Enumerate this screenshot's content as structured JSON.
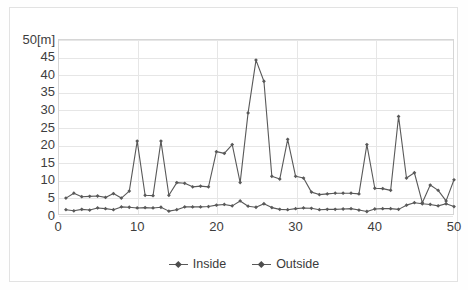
{
  "chart_data": {
    "type": "line",
    "title": "",
    "xlabel": "",
    "ylabel": "[m]",
    "y_unit_label": "50[m]",
    "xlim": [
      0,
      50
    ],
    "ylim": [
      0,
      50
    ],
    "y_ticks": [
      0,
      5,
      10,
      15,
      20,
      25,
      30,
      35,
      40,
      45,
      50
    ],
    "y_tick_labels": [
      "0",
      "5",
      "10",
      "15",
      "20",
      "25",
      "30",
      "35",
      "40",
      "45",
      "50[m]"
    ],
    "x_ticks": [
      0,
      10,
      20,
      30,
      40,
      50
    ],
    "x_tick_labels": [
      "0",
      "10",
      "20",
      "30",
      "40",
      "50"
    ],
    "grid": true,
    "legend_position": "bottom",
    "marker": "diamond",
    "x": [
      1,
      2,
      3,
      4,
      5,
      6,
      7,
      8,
      9,
      10,
      11,
      12,
      13,
      14,
      15,
      16,
      17,
      18,
      19,
      20,
      21,
      22,
      23,
      24,
      25,
      26,
      27,
      28,
      29,
      30,
      31,
      32,
      33,
      34,
      35,
      36,
      37,
      38,
      39,
      40,
      41,
      42,
      43,
      44,
      45,
      46,
      47,
      48,
      49,
      50
    ],
    "series": [
      {
        "name": "Inside",
        "color": "#595959",
        "values": [
          1.5,
          1.2,
          1.6,
          1.4,
          2.0,
          1.8,
          1.5,
          2.3,
          2.2,
          2.0,
          2.1,
          2.0,
          2.2,
          1.1,
          1.5,
          2.3,
          2.3,
          2.3,
          2.4,
          2.8,
          3.0,
          2.6,
          4.0,
          2.5,
          2.2,
          3.2,
          2.1,
          1.6,
          1.5,
          1.8,
          2.0,
          1.9,
          1.5,
          1.6,
          1.6,
          1.7,
          1.8,
          1.4,
          1.0,
          1.7,
          1.8,
          1.8,
          1.6,
          2.8,
          3.5,
          3.2,
          3.0,
          2.6,
          3.2,
          2.4
        ]
      },
      {
        "name": "Outside",
        "color": "#595959",
        "values": [
          4.8,
          6.2,
          5.2,
          5.3,
          5.4,
          5.0,
          6.1,
          4.8,
          6.8,
          21.0,
          5.6,
          5.5,
          21.0,
          5.6,
          9.2,
          9.0,
          8.0,
          8.2,
          8.0,
          18.0,
          17.5,
          20.0,
          9.2,
          29.0,
          44.0,
          38.0,
          11.0,
          10.2,
          21.5,
          11.0,
          10.5,
          6.5,
          5.8,
          6.0,
          6.2,
          6.2,
          6.2,
          6.0,
          20.0,
          7.6,
          7.5,
          7.0,
          28.0,
          10.5,
          12.0,
          3.5,
          8.5,
          7.0,
          4.0,
          10.0
        ]
      }
    ]
  },
  "legend": {
    "items": [
      {
        "label": "Inside"
      },
      {
        "label": "Outside"
      }
    ]
  }
}
